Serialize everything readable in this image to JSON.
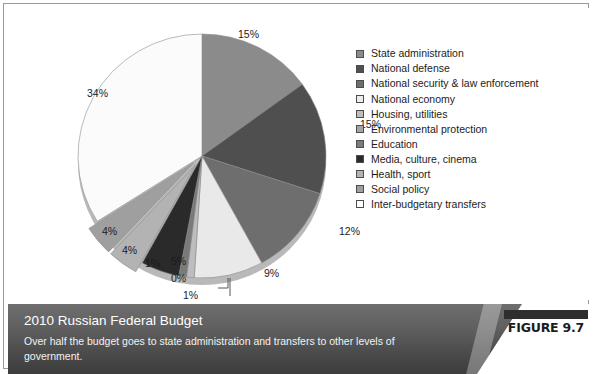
{
  "chart_data": {
    "type": "pie",
    "title": "2010 Russian Federal Budget",
    "xlabel": "",
    "ylabel": "",
    "grid": false,
    "legend_position": "right",
    "units": "percent of federal budget",
    "start_angle_deg": 0,
    "rotation": "clockwise from 12 o'clock",
    "categories": [
      "State administration",
      "National defense",
      "National security & law enforcement",
      "National economy",
      "Housing, utilities",
      "Environmental protection",
      "Education",
      "Media, culture, cinema",
      "Health, sport",
      "Social policy",
      "Inter-budgetary transfers"
    ],
    "values": [
      15,
      15,
      12,
      9,
      1,
      0,
      1,
      5,
      4,
      4,
      34
    ],
    "data_labels": [
      "15%",
      "15%",
      "12%",
      "9%",
      "1%",
      "0%",
      "1%",
      "5%",
      "4%",
      "4%",
      "34%"
    ],
    "colors": [
      "#8b8b8b",
      "#4f4f4f",
      "#6e6e6e",
      "#e9e9e9",
      "#bdbdbd",
      "#a5a5a5",
      "#7a7a7a",
      "#2a2a2a",
      "#b3b3b3",
      "#9f9f9f",
      "#fbfbfb"
    ],
    "exploded_slices": [
      "Health, sport",
      "Social policy"
    ],
    "slice_labels_with_leader_lines": [
      "0%",
      "1%"
    ]
  },
  "legend": {
    "items": [
      {
        "label": "State administration",
        "swatch": "#8b8b8b"
      },
      {
        "label": "National defense",
        "swatch": "#4f4f4f"
      },
      {
        "label": "National security & law enforcement",
        "swatch": "#6e6e6e"
      },
      {
        "label": "National economy",
        "swatch": "#ececec"
      },
      {
        "label": "Housing, utilities",
        "swatch": "#bdbdbd"
      },
      {
        "label": "Environmental protection",
        "swatch": "#a5a5a5"
      },
      {
        "label": "Education",
        "swatch": "#7a7a7a"
      },
      {
        "label": "Media, culture, cinema",
        "swatch": "#2a2a2a"
      },
      {
        "label": "Health, sport",
        "swatch": "#b3b3b3"
      },
      {
        "label": "Social policy",
        "swatch": "#9f9f9f"
      },
      {
        "label": "Inter-budgetary transfers",
        "swatch": "#ffffff"
      }
    ]
  },
  "pie_labels": [
    {
      "text": "15%",
      "x": 178,
      "y": 12
    },
    {
      "text": "15%",
      "x": 300,
      "y": 102
    },
    {
      "text": "12%",
      "x": 279,
      "y": 209
    },
    {
      "text": "9%",
      "x": 204,
      "y": 251
    },
    {
      "text": "34%",
      "x": 27,
      "y": 71
    },
    {
      "text": "4%",
      "x": 42,
      "y": 209
    },
    {
      "text": "4%",
      "x": 62,
      "y": 228
    },
    {
      "text": "1%",
      "x": 85,
      "y": 241
    },
    {
      "text": "5%",
      "x": 111,
      "y": 239
    },
    {
      "text": "0%",
      "x": 111,
      "y": 256
    },
    {
      "text": "1%",
      "x": 123,
      "y": 273
    }
  ],
  "caption": {
    "title": "2010 Russian Federal Budget",
    "description": "Over half the budget goes to state administration and transfers to other levels of government."
  },
  "figure_badge": {
    "text": "FIGURE 9.7"
  }
}
